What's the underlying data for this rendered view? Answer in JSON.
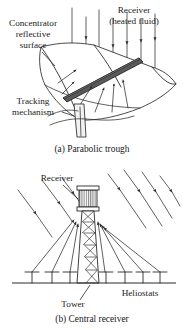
{
  "figure": {
    "background_color": "#ffffff",
    "line_color": "#2b2b2b",
    "tube_color": "#5a5a5a"
  },
  "panel_a": {
    "caption": "(a)  Parabolic trough",
    "labels": {
      "concentrator_line1": "Concentrator",
      "concentrator_line2": "reflective",
      "concentrator_line3": "surface",
      "receiver_line1": "Receiver",
      "receiver_line2": "(heated fluid)",
      "tracking_line1": "Tracking",
      "tracking_line2": "mechanism"
    },
    "elements": {
      "reflector_name": "parabolic-trough-reflector",
      "receiver_tube_name": "receiver-tube",
      "pedestal_name": "tracking-pedestal",
      "incident_rays": 7,
      "reflected_rays": 5
    }
  },
  "panel_b": {
    "caption": "(b)  Central receiver",
    "labels": {
      "receiver": "Receiver",
      "tower": "Tower",
      "heliostats": "Heliostats"
    },
    "elements": {
      "receiver_box_name": "central-receiver-box",
      "tower_name": "lattice-tower",
      "ground_name": "ground-line",
      "heliostats_left_x": [
        32,
        52,
        70
      ],
      "heliostats_right_x": [
        105,
        125,
        143,
        160
      ],
      "heliostat_count": 7,
      "incident_rays": 7,
      "reflected_rays": 7
    }
  }
}
